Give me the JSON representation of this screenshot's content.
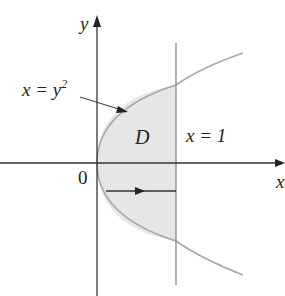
{
  "labels": {
    "y_axis": "y",
    "x_axis": "x",
    "origin": "0",
    "curve_lhs": "x = y",
    "curve_exp": "2",
    "region": "D",
    "line": "x = 1"
  },
  "colors": {
    "axis": "#333333",
    "curve": "#a8a8a8",
    "fill": "#e6e6e6",
    "line": "#888888"
  }
}
